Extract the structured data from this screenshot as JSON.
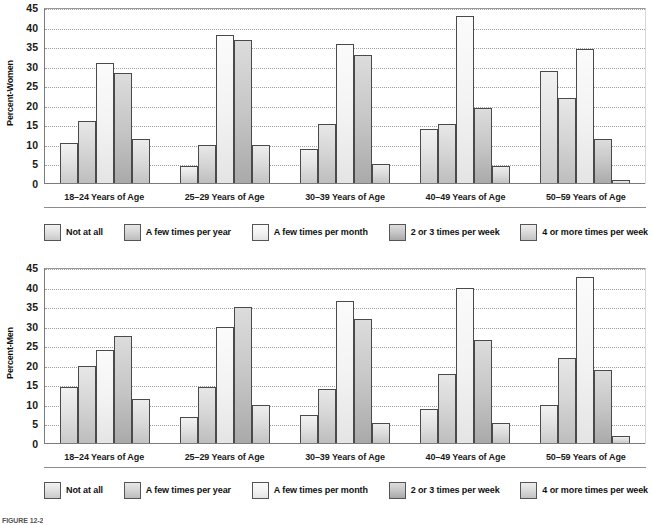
{
  "figure": {
    "caption": "FIGURE 12-2"
  },
  "legend": {
    "items": [
      {
        "label": "Not at all",
        "swatch": "#eeeeee"
      },
      {
        "label": "A few times per year",
        "swatch": "#d9d9d9"
      },
      {
        "label": "A few times per month",
        "swatch": "#f7f7f7"
      },
      {
        "label": "2 or 3 times per week",
        "swatch": "#c3c3c3"
      },
      {
        "label": "4 or more times per week",
        "swatch": "#dedede"
      }
    ]
  },
  "chart_data": [
    {
      "type": "bar",
      "title": "",
      "panel": "women",
      "ylabel": "Percent-Women",
      "xlabel": "",
      "ylim": [
        0,
        45
      ],
      "yticks": [
        0,
        5,
        10,
        15,
        20,
        25,
        30,
        35,
        40,
        45
      ],
      "grid": true,
      "legend_position": "bottom",
      "categories": [
        "18–24 Years of Age",
        "25–29 Years of Age",
        "30–39 Years of Age",
        "40–49 Years of Age",
        "50–59 Years of Age"
      ],
      "series": [
        {
          "name": "Not at all",
          "values": [
            10.5,
            4.5,
            9.0,
            14.0,
            29.0
          ]
        },
        {
          "name": "A few times per year",
          "values": [
            16.0,
            10.0,
            15.3,
            15.3,
            22.0
          ]
        },
        {
          "name": "A few times per month",
          "values": [
            31.0,
            38.0,
            35.8,
            43.0,
            34.5
          ]
        },
        {
          "name": "2 or 3 times per week",
          "values": [
            28.5,
            36.8,
            33.0,
            19.5,
            11.5
          ]
        },
        {
          "name": "4 or more times per week",
          "values": [
            11.5,
            10.0,
            5.0,
            4.5,
            1.0
          ]
        }
      ]
    },
    {
      "type": "bar",
      "title": "",
      "panel": "men",
      "ylabel": "Percent-Men",
      "xlabel": "",
      "ylim": [
        0,
        45
      ],
      "yticks": [
        0,
        5,
        10,
        15,
        20,
        25,
        30,
        35,
        40,
        45
      ],
      "grid": true,
      "legend_position": "bottom",
      "categories": [
        "18–24 Years of Age",
        "25–29 Years of Age",
        "30–39 Years of Age",
        "40–49 Years of Age",
        "50–59 Years of Age"
      ],
      "series": [
        {
          "name": "Not at all",
          "values": [
            14.5,
            6.8,
            7.5,
            9.0,
            10.0
          ]
        },
        {
          "name": "A few times per year",
          "values": [
            20.0,
            14.5,
            14.0,
            17.8,
            22.0
          ]
        },
        {
          "name": "A few times per month",
          "values": [
            24.0,
            30.0,
            36.5,
            39.8,
            42.8
          ]
        },
        {
          "name": "2 or 3 times per week",
          "values": [
            27.5,
            35.0,
            32.0,
            26.5,
            19.0
          ]
        },
        {
          "name": "4 or more times per week",
          "values": [
            11.5,
            10.0,
            5.5,
            5.3,
            2.0
          ]
        }
      ]
    }
  ]
}
